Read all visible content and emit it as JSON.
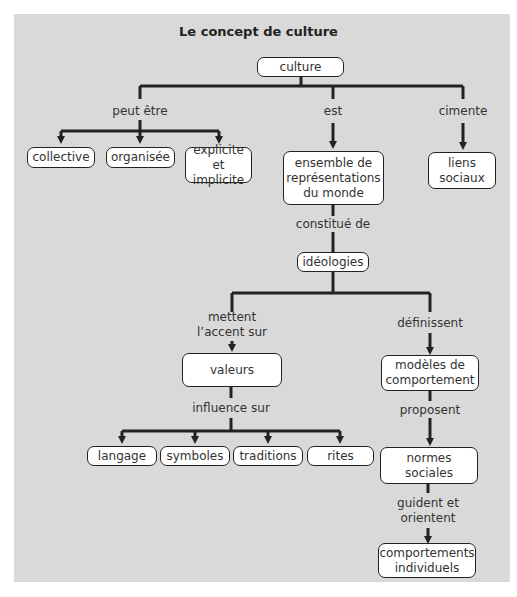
{
  "title": "Le concept de culture",
  "nodes": {
    "culture": "culture",
    "collective": "collective",
    "organisee": "organisée",
    "explicite_l1": "explicite",
    "explicite_l2": "et implicite",
    "ensemble_l1": "ensemble de",
    "ensemble_l2": "représentations",
    "ensemble_l3": "du monde",
    "liens_l1": "liens",
    "liens_l2": "sociaux",
    "ideologies": "idéologies",
    "valeurs": "valeurs",
    "modeles_l1": "modèles de",
    "modeles_l2": "comportement",
    "langage": "langage",
    "symboles": "symboles",
    "traditions": "traditions",
    "rites": "rites",
    "normes_l1": "normes",
    "normes_l2": "sociales",
    "comportements_l1": "comportements",
    "comportements_l2": "individuels"
  },
  "links": {
    "peut_etre": "peut être",
    "est": "est",
    "cimente": "cimente",
    "constitue_de": "constitué de",
    "mettent_l1": "mettent",
    "mettent_l2": "l’accent sur",
    "definissent": "définissent",
    "influence_sur": "influence sur",
    "proposent": "proposent",
    "guident_l1": "guident et",
    "guident_l2": "orientent"
  },
  "colors": {
    "background": "#d9d9d9",
    "node_fill": "#ffffff",
    "line": "#222222"
  }
}
